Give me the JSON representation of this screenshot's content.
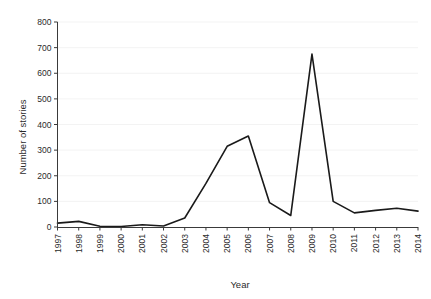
{
  "chart_data": {
    "type": "line",
    "title": "",
    "xlabel": "Year",
    "ylabel": "Number of stories",
    "categories": [
      "1997",
      "1998",
      "1999",
      "2000",
      "2001",
      "2002",
      "2003",
      "2004",
      "2005",
      "2006",
      "2007",
      "2008",
      "2009",
      "2010",
      "2011",
      "2012",
      "2013",
      "2014"
    ],
    "x": [
      1997,
      1998,
      1999,
      2000,
      2001,
      2002,
      2003,
      2004,
      2005,
      2006,
      2007,
      2008,
      2009,
      2010,
      2011,
      2012,
      2013,
      2014
    ],
    "values": [
      15,
      22,
      3,
      2,
      9,
      4,
      35,
      170,
      315,
      355,
      95,
      45,
      675,
      100,
      55,
      65,
      73,
      62
    ],
    "series": [
      {
        "name": "Number of stories",
        "values": [
          15,
          22,
          3,
          2,
          9,
          4,
          35,
          170,
          315,
          355,
          95,
          45,
          675,
          100,
          55,
          65,
          73,
          62
        ]
      }
    ],
    "ylim": [
      0,
      800
    ],
    "yticks": [
      0,
      100,
      200,
      300,
      400,
      500,
      600,
      700,
      800
    ],
    "ytick_labels": [
      "0",
      "100",
      "200",
      "300",
      "400",
      "500",
      "600",
      "700",
      "800"
    ],
    "xlim": [
      1997,
      2014
    ],
    "grid": "horizontal-faint",
    "legend": "none",
    "line_color": "#1a1a1a",
    "background_color": "#ffffff",
    "xtick_rotation": 90
  }
}
